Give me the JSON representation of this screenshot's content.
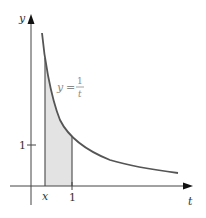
{
  "diagram": {
    "axes": {
      "x_label": "t",
      "y_label": "y"
    },
    "curve": {
      "equation_lhs": "y",
      "equation_eq": "=",
      "equation_num": "1",
      "equation_den": "t",
      "color": "#555555"
    },
    "ticks": {
      "y_one": "1",
      "x_one": "1",
      "x_var": "x"
    },
    "shading": {
      "color": "#e3e3e3",
      "from": "x",
      "to": "1"
    }
  }
}
